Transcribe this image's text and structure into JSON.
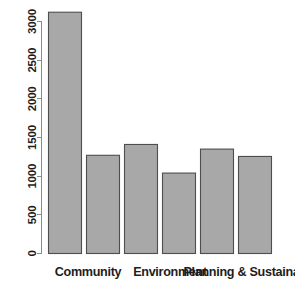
{
  "chart_data": {
    "type": "bar",
    "title": "",
    "subtitle": "",
    "xlabel": "",
    "ylabel": "",
    "categories": [
      "Community",
      "",
      "Environment",
      "",
      "Planning & Sustainabili",
      ""
    ],
    "values": [
      3120,
      1270,
      1410,
      1040,
      1350,
      1255
    ],
    "ylim": [
      0,
      3200
    ],
    "yticks": [
      0,
      500,
      1000,
      1500,
      2000,
      2500,
      3000
    ],
    "ytick_labels": [
      "0",
      "500",
      "1000",
      "1500",
      "2000",
      "2500",
      "3000"
    ],
    "xtick_labels": [
      "Community",
      "Environment",
      "Planning & Sustainabili"
    ],
    "grid": false,
    "legend": null,
    "bar_fill_color": "#a8a8a8",
    "bar_border_color": "#4e4e4e",
    "axis_color": "#8a8a8a",
    "text_color": "#1d1d1d",
    "background_color": "#ffffff",
    "ytick_label_rotation": 90
  },
  "geometry": {
    "plot_left": 48,
    "plot_right": 273,
    "baseline_y": 253,
    "top_value_y": 21,
    "top_value": 3000,
    "bar_width": 33,
    "bar_gap": 5,
    "tick_length": 5,
    "axis_x": 41,
    "xlabel_y": 276,
    "xlabel_x_positions": [
      88,
      170,
      250
    ]
  }
}
